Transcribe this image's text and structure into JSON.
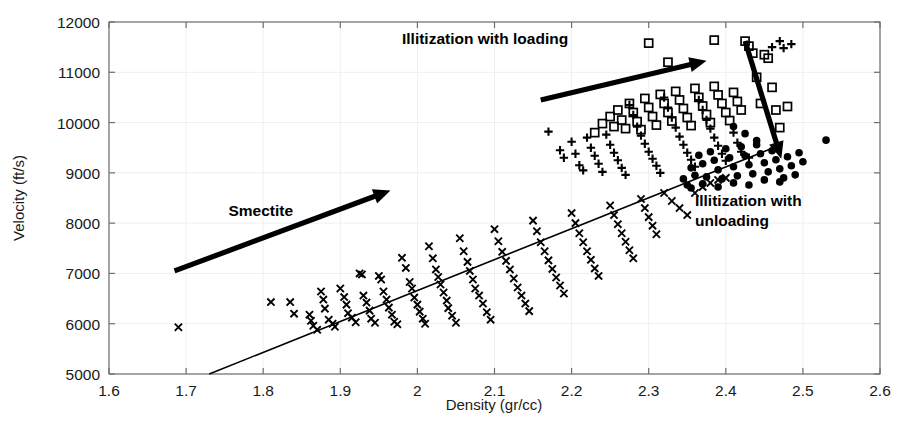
{
  "chart_data": {
    "type": "scatter",
    "title": "",
    "xlabel": "Density (gr/cc)",
    "ylabel": "Velocity (ft/s)",
    "xlim": [
      1.6,
      2.6
    ],
    "ylim": [
      5000,
      12000
    ],
    "xticks": [
      1.6,
      1.7,
      1.8,
      1.9,
      2,
      2.1,
      2.2,
      2.3,
      2.4,
      2.5,
      2.6
    ],
    "xticklabels": [
      "1.6",
      "1.7",
      "1.8",
      "1.9",
      "2",
      "2.1",
      "2.2",
      "2.3",
      "2.4",
      "2.5",
      "2.6"
    ],
    "yticks": [
      5000,
      6000,
      7000,
      8000,
      9000,
      10000,
      11000,
      12000
    ],
    "yticklabels": [
      "5000",
      "6000",
      "7000",
      "8000",
      "9000",
      "10000",
      "11000",
      "12000"
    ],
    "grid": true,
    "legend": "none",
    "marker_color": "#000000",
    "series": [
      {
        "name": "smectite-trend",
        "marker": "x",
        "points": [
          [
            1.69,
            5930
          ],
          [
            1.81,
            6430
          ],
          [
            1.835,
            6430
          ],
          [
            1.84,
            6200
          ],
          [
            1.86,
            6180
          ],
          [
            1.862,
            6060
          ],
          [
            1.865,
            5960
          ],
          [
            1.87,
            5880
          ],
          [
            1.875,
            6640
          ],
          [
            1.878,
            6480
          ],
          [
            1.88,
            6300
          ],
          [
            1.885,
            6080
          ],
          [
            1.89,
            6000
          ],
          [
            1.893,
            5940
          ],
          [
            1.9,
            6700
          ],
          [
            1.905,
            6530
          ],
          [
            1.908,
            6380
          ],
          [
            1.91,
            6210
          ],
          [
            1.915,
            6120
          ],
          [
            1.92,
            6030
          ],
          [
            1.925,
            7000
          ],
          [
            1.928,
            6980
          ],
          [
            1.93,
            6560
          ],
          [
            1.934,
            6420
          ],
          [
            1.938,
            6260
          ],
          [
            1.94,
            6100
          ],
          [
            1.945,
            6020
          ],
          [
            1.95,
            6950
          ],
          [
            1.953,
            6880
          ],
          [
            1.956,
            6640
          ],
          [
            1.96,
            6480
          ],
          [
            1.963,
            6320
          ],
          [
            1.967,
            6180
          ],
          [
            1.97,
            6040
          ],
          [
            1.974,
            5990
          ],
          [
            1.98,
            7310
          ],
          [
            1.985,
            7110
          ],
          [
            1.99,
            6830
          ],
          [
            1.993,
            6700
          ],
          [
            1.996,
            6520
          ],
          [
            2.0,
            6380
          ],
          [
            2.003,
            6240
          ],
          [
            2.007,
            6100
          ],
          [
            2.01,
            6000
          ],
          [
            2.015,
            7540
          ],
          [
            2.02,
            7300
          ],
          [
            2.024,
            7080
          ],
          [
            2.027,
            6930
          ],
          [
            2.03,
            6780
          ],
          [
            2.034,
            6620
          ],
          [
            2.038,
            6460
          ],
          [
            2.04,
            6310
          ],
          [
            2.045,
            6160
          ],
          [
            2.05,
            6020
          ],
          [
            2.055,
            7700
          ],
          [
            2.06,
            7440
          ],
          [
            2.065,
            7230
          ],
          [
            2.068,
            7050
          ],
          [
            2.072,
            6880
          ],
          [
            2.075,
            6700
          ],
          [
            2.08,
            6560
          ],
          [
            2.085,
            6400
          ],
          [
            2.09,
            6230
          ],
          [
            2.095,
            6080
          ],
          [
            2.1,
            7880
          ],
          [
            2.105,
            7640
          ],
          [
            2.11,
            7430
          ],
          [
            2.115,
            7250
          ],
          [
            2.12,
            7080
          ],
          [
            2.125,
            6900
          ],
          [
            2.13,
            6720
          ],
          [
            2.135,
            6560
          ],
          [
            2.14,
            6400
          ],
          [
            2.145,
            6250
          ],
          [
            2.15,
            8050
          ],
          [
            2.155,
            7840
          ],
          [
            2.16,
            7620
          ],
          [
            2.165,
            7440
          ],
          [
            2.17,
            7260
          ],
          [
            2.175,
            7090
          ],
          [
            2.18,
            6920
          ],
          [
            2.185,
            6760
          ],
          [
            2.19,
            6600
          ],
          [
            2.2,
            8200
          ],
          [
            2.205,
            8000
          ],
          [
            2.21,
            7800
          ],
          [
            2.215,
            7620
          ],
          [
            2.22,
            7440
          ],
          [
            2.225,
            7270
          ],
          [
            2.23,
            7100
          ],
          [
            2.235,
            6950
          ],
          [
            2.25,
            8350
          ],
          [
            2.255,
            8160
          ],
          [
            2.26,
            7980
          ],
          [
            2.265,
            7800
          ],
          [
            2.27,
            7630
          ],
          [
            2.275,
            7460
          ],
          [
            2.28,
            7300
          ],
          [
            2.29,
            8480
          ],
          [
            2.295,
            8300
          ],
          [
            2.3,
            8120
          ],
          [
            2.305,
            7950
          ],
          [
            2.31,
            7780
          ],
          [
            2.32,
            8600
          ],
          [
            2.33,
            8440
          ],
          [
            2.34,
            8300
          ],
          [
            2.35,
            8160
          ],
          [
            2.36,
            8600
          ],
          [
            2.37,
            8720
          ],
          [
            2.38,
            8800
          ],
          [
            2.39,
            8860
          ],
          [
            2.4,
            8900
          ]
        ]
      },
      {
        "name": "illitization-loading-plus",
        "marker": "plus",
        "points": [
          [
            2.17,
            9820
          ],
          [
            2.185,
            9450
          ],
          [
            2.19,
            9300
          ],
          [
            2.2,
            9620
          ],
          [
            2.205,
            9380
          ],
          [
            2.21,
            9150
          ],
          [
            2.215,
            9050
          ],
          [
            2.22,
            9700
          ],
          [
            2.225,
            9500
          ],
          [
            2.23,
            9340
          ],
          [
            2.235,
            9180
          ],
          [
            2.24,
            9020
          ],
          [
            2.245,
            9760
          ],
          [
            2.25,
            9560
          ],
          [
            2.255,
            9400
          ],
          [
            2.26,
            9250
          ],
          [
            2.265,
            9100
          ],
          [
            2.27,
            8960
          ],
          [
            2.275,
            10350
          ],
          [
            2.28,
            10150
          ],
          [
            2.285,
            9920
          ],
          [
            2.29,
            9740
          ],
          [
            2.295,
            9580
          ],
          [
            2.3,
            9420
          ],
          [
            2.305,
            9280
          ],
          [
            2.31,
            9140
          ],
          [
            2.315,
            9000
          ],
          [
            2.32,
            10500
          ],
          [
            2.325,
            10300
          ],
          [
            2.33,
            10100
          ],
          [
            2.335,
            9900
          ],
          [
            2.34,
            9720
          ],
          [
            2.345,
            9560
          ],
          [
            2.35,
            9400
          ],
          [
            2.355,
            9260
          ],
          [
            2.36,
            9120
          ],
          [
            2.365,
            10450
          ],
          [
            2.37,
            10250
          ],
          [
            2.375,
            10050
          ],
          [
            2.38,
            9880
          ],
          [
            2.385,
            9700
          ],
          [
            2.39,
            9540
          ],
          [
            2.395,
            9380
          ],
          [
            2.4,
            9240
          ],
          [
            2.41,
            9800
          ],
          [
            2.415,
            9600
          ],
          [
            2.42,
            9420
          ],
          [
            2.43,
            9300
          ],
          [
            2.46,
            11500
          ],
          [
            2.47,
            11620
          ],
          [
            2.475,
            11480
          ],
          [
            2.485,
            11560
          ]
        ]
      },
      {
        "name": "illitization-loading-square",
        "marker": "square",
        "points": [
          [
            2.23,
            9800
          ],
          [
            2.24,
            9980
          ],
          [
            2.25,
            10120
          ],
          [
            2.255,
            9920
          ],
          [
            2.26,
            10250
          ],
          [
            2.265,
            10050
          ],
          [
            2.27,
            9880
          ],
          [
            2.275,
            10380
          ],
          [
            2.28,
            10200
          ],
          [
            2.285,
            10020
          ],
          [
            2.29,
            9860
          ],
          [
            2.295,
            10480
          ],
          [
            2.3,
            10300
          ],
          [
            2.305,
            10120
          ],
          [
            2.31,
            9950
          ],
          [
            2.315,
            10560
          ],
          [
            2.32,
            10380
          ],
          [
            2.325,
            10200
          ],
          [
            2.33,
            10030
          ],
          [
            2.335,
            10620
          ],
          [
            2.34,
            10450
          ],
          [
            2.345,
            10280
          ],
          [
            2.35,
            10100
          ],
          [
            2.355,
            9940
          ],
          [
            2.36,
            10680
          ],
          [
            2.365,
            10500
          ],
          [
            2.37,
            10330
          ],
          [
            2.375,
            10160
          ],
          [
            2.38,
            10000
          ],
          [
            2.385,
            10720
          ],
          [
            2.39,
            10550
          ],
          [
            2.395,
            10380
          ],
          [
            2.4,
            10200
          ],
          [
            2.405,
            10040
          ],
          [
            2.41,
            10600
          ],
          [
            2.415,
            10420
          ],
          [
            2.42,
            10250
          ],
          [
            2.425,
            11620
          ],
          [
            2.43,
            11520
          ],
          [
            2.435,
            11380
          ],
          [
            2.44,
            10900
          ],
          [
            2.445,
            10380
          ],
          [
            2.45,
            11350
          ],
          [
            2.455,
            11280
          ],
          [
            2.46,
            10700
          ],
          [
            2.465,
            10250
          ],
          [
            2.47,
            9900
          ],
          [
            2.48,
            10320
          ],
          [
            2.385,
            11640
          ],
          [
            2.3,
            11580
          ],
          [
            2.325,
            11200
          ]
        ]
      },
      {
        "name": "illitization-unloading-filled",
        "marker": "circle",
        "points": [
          [
            2.355,
            9100
          ],
          [
            2.36,
            8950
          ],
          [
            2.365,
            9350
          ],
          [
            2.37,
            9180
          ],
          [
            2.375,
            8920
          ],
          [
            2.38,
            9420
          ],
          [
            2.385,
            9250
          ],
          [
            2.39,
            9060
          ],
          [
            2.395,
            8880
          ],
          [
            2.4,
            9480
          ],
          [
            2.405,
            9300
          ],
          [
            2.41,
            9120
          ],
          [
            2.415,
            8940
          ],
          [
            2.42,
            9520
          ],
          [
            2.425,
            9340
          ],
          [
            2.43,
            9160
          ],
          [
            2.435,
            8980
          ],
          [
            2.44,
            9560
          ],
          [
            2.445,
            9380
          ],
          [
            2.45,
            9200
          ],
          [
            2.455,
            9020
          ],
          [
            2.46,
            9440
          ],
          [
            2.465,
            9260
          ],
          [
            2.47,
            9080
          ],
          [
            2.475,
            8900
          ],
          [
            2.48,
            9320
          ],
          [
            2.485,
            9140
          ],
          [
            2.49,
            8960
          ],
          [
            2.495,
            9400
          ],
          [
            2.5,
            9220
          ],
          [
            2.345,
            8880
          ],
          [
            2.35,
            8760
          ],
          [
            2.355,
            8700
          ],
          [
            2.37,
            8780
          ],
          [
            2.39,
            8720
          ],
          [
            2.41,
            8800
          ],
          [
            2.43,
            8760
          ],
          [
            2.45,
            8860
          ],
          [
            2.47,
            8820
          ],
          [
            2.53,
            9650
          ],
          [
            2.41,
            9920
          ],
          [
            2.425,
            9780
          ],
          [
            2.44,
            9640
          ]
        ]
      }
    ],
    "trend_line": {
      "name": "smectite-regression-line",
      "x1": 1.73,
      "y1": 5000,
      "x2": 2.47,
      "y2": 9550
    },
    "annotations": [
      {
        "name": "smectite",
        "text": "Smectite",
        "text_x": 1.755,
        "text_y": 8150,
        "arrow": {
          "x1": 1.685,
          "y1": 7050,
          "x2": 1.965,
          "y2": 8650
        }
      },
      {
        "name": "illitization-with-loading",
        "text": "Illitization with loading",
        "text_x": 1.98,
        "text_y": 11560,
        "arrow": {
          "x1": 2.16,
          "y1": 10450,
          "x2": 2.375,
          "y2": 11230
        }
      },
      {
        "name": "illitization-with-unloading",
        "text": "Illitization with\nunloading",
        "line1": "Illitization with",
        "line2": "unloading",
        "text_x": 2.36,
        "text_y": 8350,
        "arrow": {
          "x1": 2.425,
          "y1": 11620,
          "x2": 2.472,
          "y2": 9280
        }
      }
    ]
  },
  "caption_fragment": ""
}
